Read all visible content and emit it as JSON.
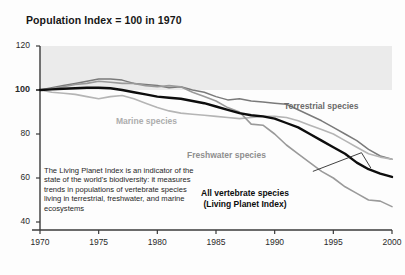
{
  "figure": {
    "title": "Population Index = 100 in 1970",
    "annotation": "The Living Planet Index is an indicator of the state of the world's biodiversity: it measures trends in populations of vertebrate species living in terrestrial, freshwater, and marine ecosystems",
    "labels": {
      "terrestrial": "Terrestrial species",
      "marine": "Marine species",
      "freshwater": "Freshwater species",
      "vertebrate_line1": "All vertebrate species",
      "vertebrate_line2": "(Living Planet Index)"
    }
  },
  "chart_data": {
    "type": "line",
    "title": "Population Index = 100 in 1970",
    "xlabel": "",
    "ylabel": "",
    "xlim": [
      1970,
      2000
    ],
    "ylim": [
      40,
      120
    ],
    "grid": false,
    "legend": "inline-labels",
    "yticks": [
      40,
      60,
      80,
      100,
      120
    ],
    "ytick_labels": [
      "40",
      "60",
      "80",
      "100",
      "120"
    ],
    "emphasized_ytick": "100",
    "xticks": [
      1970,
      1975,
      1980,
      1985,
      1990,
      1995,
      2000
    ],
    "xtick_labels": [
      "1970",
      "1975",
      "1980",
      "1985",
      "1990",
      "1995",
      "2000"
    ],
    "x": [
      1970,
      1971,
      1972,
      1973,
      1974,
      1975,
      1976,
      1977,
      1978,
      1979,
      1980,
      1981,
      1982,
      1983,
      1984,
      1985,
      1986,
      1987,
      1988,
      1989,
      1990,
      1991,
      1992,
      1993,
      1994,
      1995,
      1996,
      1997,
      1998,
      1999,
      2000
    ],
    "series": [
      {
        "name": "Terrestrial species",
        "color": "#7a7a7a",
        "width": 1.5,
        "values": [
          100,
          101,
          102,
          103,
          104,
          105,
          105,
          104.5,
          103,
          102.5,
          102,
          101,
          101.5,
          100,
          99,
          97,
          95.5,
          96,
          95,
          94.5,
          94,
          93.5,
          91,
          88.5,
          86,
          83,
          80,
          77,
          73,
          70,
          68.5
        ]
      },
      {
        "name": "Marine species",
        "color": "#b5b5b5",
        "width": 1.6,
        "values": [
          100,
          99,
          98.5,
          98,
          97,
          96,
          97,
          97.5,
          96,
          94,
          92,
          90.5,
          89.5,
          89,
          88.5,
          88,
          87.5,
          87,
          87.5,
          88,
          88,
          87.5,
          86,
          84,
          82,
          80,
          77,
          74,
          71,
          69.5,
          68.5
        ]
      },
      {
        "name": "Freshwater species",
        "color": "#9a9a9a",
        "width": 1.6,
        "values": [
          100,
          100.5,
          101.5,
          102.5,
          103,
          104,
          103.5,
          103,
          103,
          102,
          101.5,
          102,
          101.5,
          99,
          97,
          95,
          92,
          90,
          84.5,
          84,
          80,
          75,
          71,
          67,
          63,
          60,
          56,
          53,
          50,
          49.5,
          47
        ]
      },
      {
        "name": "All vertebrate species (Living Planet Index)",
        "color": "#0d0d0d",
        "width": 2.4,
        "values": [
          100,
          100.3,
          100.6,
          100.8,
          101,
          101,
          100.8,
          100,
          99,
          98,
          97,
          96.5,
          96,
          95,
          94,
          92.5,
          91,
          89.5,
          88.5,
          88,
          87,
          85,
          83,
          80,
          77,
          74,
          71,
          67,
          64,
          62,
          60.5
        ]
      }
    ],
    "shaded_band": {
      "from": 100,
      "to": 120,
      "color": "#ebebeb"
    }
  }
}
